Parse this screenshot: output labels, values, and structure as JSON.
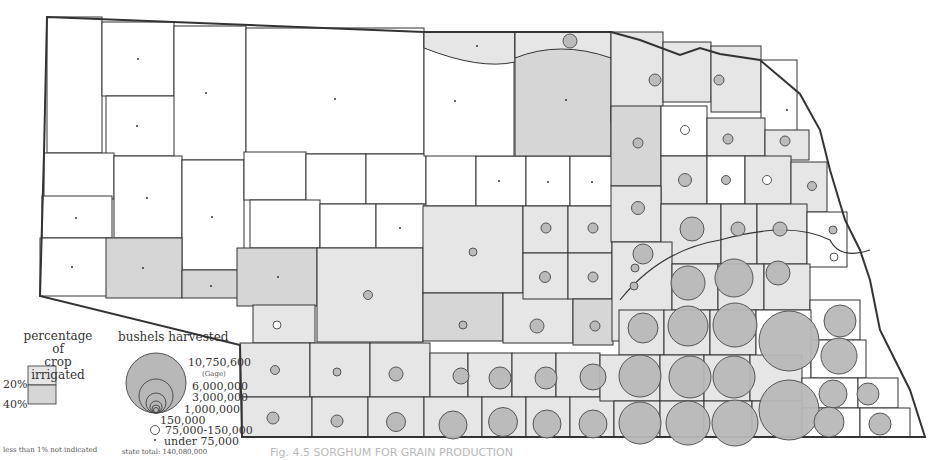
{
  "map": {
    "subject": "Sorghum for grain production by county, Nebraska",
    "colors": {
      "background": "#ffffff",
      "county_unshaded": "#ffffff",
      "county_20pct": "#e6e6e6",
      "county_40pct": "#d6d6d6",
      "circle_fill": "#b8b8b8",
      "circle_stroke": "#555555",
      "border": "#333333"
    }
  },
  "legend_irrigation": {
    "title_line1": "percentage of",
    "title_line2": "crop irrigated",
    "label_20": "20%",
    "label_40": "40%",
    "note": "less than 1% not indicated"
  },
  "legend_bushels": {
    "title": "bushels harvested",
    "labels": [
      "10,750,600",
      "(Gage)",
      "6,000,000",
      "3,000,000",
      "1,000,000",
      "150,000",
      "75,000-150,000",
      "under 75,000"
    ],
    "state_total": "state total: 140,080,000"
  },
  "caption": {
    "text": "Fig. 4.5 SORGHUM FOR GRAIN PRODUCTION"
  }
}
